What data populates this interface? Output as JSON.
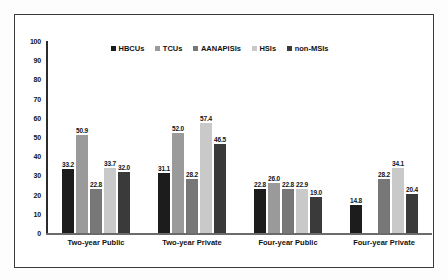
{
  "chart_data": {
    "type": "bar",
    "title": "",
    "xlabel": "",
    "ylabel": "",
    "ylim": [
      0,
      100
    ],
    "ytick_step": 10,
    "yticks": [
      "100",
      "90",
      "80",
      "70",
      "60",
      "50",
      "40",
      "30",
      "20",
      "10",
      "0"
    ],
    "grid": false,
    "legend_position": "top-center",
    "categories": [
      "Two-year Public",
      "Two-year Private",
      "Four-year Public",
      "Four-year Private"
    ],
    "series": [
      {
        "name": "HBCUs",
        "color": "#1c1c1c",
        "values": [
          33.2,
          31.1,
          22.8,
          14.8
        ],
        "labels": [
          "33.2",
          "31.1",
          "22.8",
          "14.8"
        ]
      },
      {
        "name": "TCUs",
        "color": "#9a9a9a",
        "values": [
          50.9,
          52.0,
          26.0,
          null
        ],
        "labels": [
          "50.9",
          "52.0",
          "26.0",
          ""
        ]
      },
      {
        "name": "AANAPISIs",
        "color": "#777777",
        "values": [
          22.8,
          28.2,
          22.8,
          28.2
        ],
        "labels": [
          "22.8",
          "28.2",
          "22.8",
          "28.2"
        ]
      },
      {
        "name": "HSIs",
        "color": "#c9c9c9",
        "values": [
          33.7,
          57.4,
          22.9,
          34.1
        ],
        "labels": [
          "33.7",
          "57.4",
          "22.9",
          "34.1"
        ]
      },
      {
        "name": "non-MSIs",
        "color": "#3a3a3a",
        "values": [
          32.0,
          46.5,
          19.0,
          20.4
        ],
        "labels": [
          "32.0",
          "46.5",
          "19.0",
          "20.4"
        ]
      }
    ]
  },
  "colors": {
    "frame_border": "#3a3a3a",
    "axis": "#2b2b2b",
    "baseline": "#6b6b6b",
    "text": "#111111",
    "background": "#ffffff"
  }
}
